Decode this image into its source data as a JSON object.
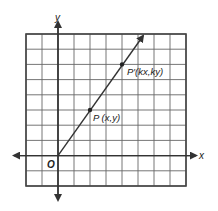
{
  "diagram": {
    "type": "coordinate-plane",
    "grid": {
      "columns": 10,
      "rows": 10,
      "origin_col": 2,
      "origin_row_from_top": 8
    },
    "axes": {
      "x_label": "x",
      "y_label": "y",
      "origin_label": "O"
    },
    "points": [
      {
        "name": "P",
        "label": "P (x,y)",
        "grid": [
          2,
          3
        ]
      },
      {
        "name": "P'",
        "label": "P′(kx,ky)",
        "grid": [
          4,
          6
        ]
      }
    ],
    "ray": {
      "from": [
        0,
        0
      ],
      "through": [
        4,
        6
      ],
      "arrow": true
    },
    "colors": {
      "grid": "#555555",
      "axis": "#333333",
      "line": "#333333",
      "background": "#ffffff"
    }
  }
}
